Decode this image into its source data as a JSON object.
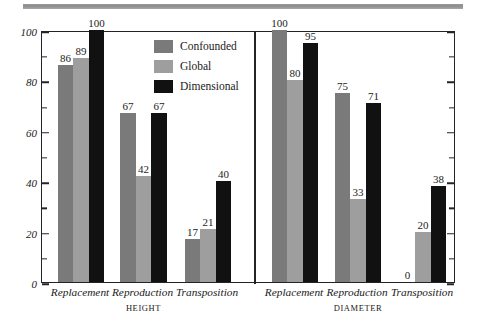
{
  "chart_data": {
    "type": "bar",
    "title": "",
    "xlabel": "",
    "ylabel": "PERCENT OF CHILDREN WHO SUCCEED",
    "ylim": [
      0,
      100
    ],
    "ytick_labels": [
      "0",
      "20",
      "40",
      "60",
      "80",
      "100"
    ],
    "ytick_values": [
      0,
      20,
      40,
      60,
      80,
      100
    ],
    "minor_tick_step": 10,
    "grid": false,
    "legend_position": "upper-center-left-panel",
    "series": [
      {
        "name": "Confounded",
        "color": "#7a7a7a",
        "values": [
          86,
          67,
          17,
          100,
          75,
          0
        ]
      },
      {
        "name": "Global",
        "color": "#9e9e9e",
        "values": [
          89,
          42,
          21,
          80,
          33,
          20
        ]
      },
      {
        "name": "Dimensional",
        "color": "#111111",
        "values": [
          100,
          67,
          40,
          95,
          71,
          38
        ]
      }
    ],
    "panels": [
      {
        "name": "HEIGHT",
        "categories": [
          "Replacement",
          "Reproduction",
          "Transposition"
        ],
        "groups": [
          {
            "category": "Replacement",
            "Confounded": 86,
            "Global": 89,
            "Dimensional": 100
          },
          {
            "category": "Reproduction",
            "Confounded": 67,
            "Global": 42,
            "Dimensional": 67
          },
          {
            "category": "Transposition",
            "Confounded": 17,
            "Global": 21,
            "Dimensional": 40
          }
        ]
      },
      {
        "name": "DIAMETER",
        "categories": [
          "Replacement",
          "Reproduction",
          "Transposition"
        ],
        "groups": [
          {
            "category": "Replacement",
            "Confounded": 100,
            "Global": 80,
            "Dimensional": 95
          },
          {
            "category": "Reproduction",
            "Confounded": 75,
            "Global": 33,
            "Dimensional": 71
          },
          {
            "category": "Transposition",
            "Confounded": 0,
            "Global": 20,
            "Dimensional": 38
          }
        ]
      }
    ]
  },
  "axis": {
    "y_title": "PERCENT OF CHILDREN WHO SUCCEED",
    "ticks": [
      {
        "label": "100",
        "value": 100
      },
      {
        "label": "80",
        "value": 80
      },
      {
        "label": "60",
        "value": 60
      },
      {
        "label": "40",
        "value": 40
      },
      {
        "label": "20",
        "value": 20
      },
      {
        "label": "0",
        "value": 0
      }
    ]
  },
  "legend": {
    "items": [
      {
        "label": "Confounded",
        "color": "#7a7a7a"
      },
      {
        "label": "Global",
        "color": "#9e9e9e"
      },
      {
        "label": "Dimensional",
        "color": "#111111"
      }
    ]
  },
  "panels": {
    "left": {
      "label": "HEIGHT",
      "categories": [
        "Replacement",
        "Reproduction",
        "Transposition"
      ]
    },
    "right": {
      "label": "DIAMETER",
      "categories": [
        "Replacement",
        "Reproduction",
        "Transposition"
      ]
    }
  },
  "labels": {
    "v_86": "86",
    "v_89": "89",
    "v_100a": "100",
    "v_67a": "67",
    "v_42": "42",
    "v_67b": "67",
    "v_17": "17",
    "v_21": "21",
    "v_40": "40",
    "v_100b": "100",
    "v_80": "80",
    "v_95": "95",
    "v_75": "75",
    "v_33": "33",
    "v_71": "71",
    "v_0": "0",
    "v_20": "20",
    "v_38": "38"
  },
  "colors": {
    "confounded": "#7a7a7a",
    "global": "#9e9e9e",
    "dimensional": "#111111",
    "axis": "#242424",
    "rule": "#979797"
  }
}
